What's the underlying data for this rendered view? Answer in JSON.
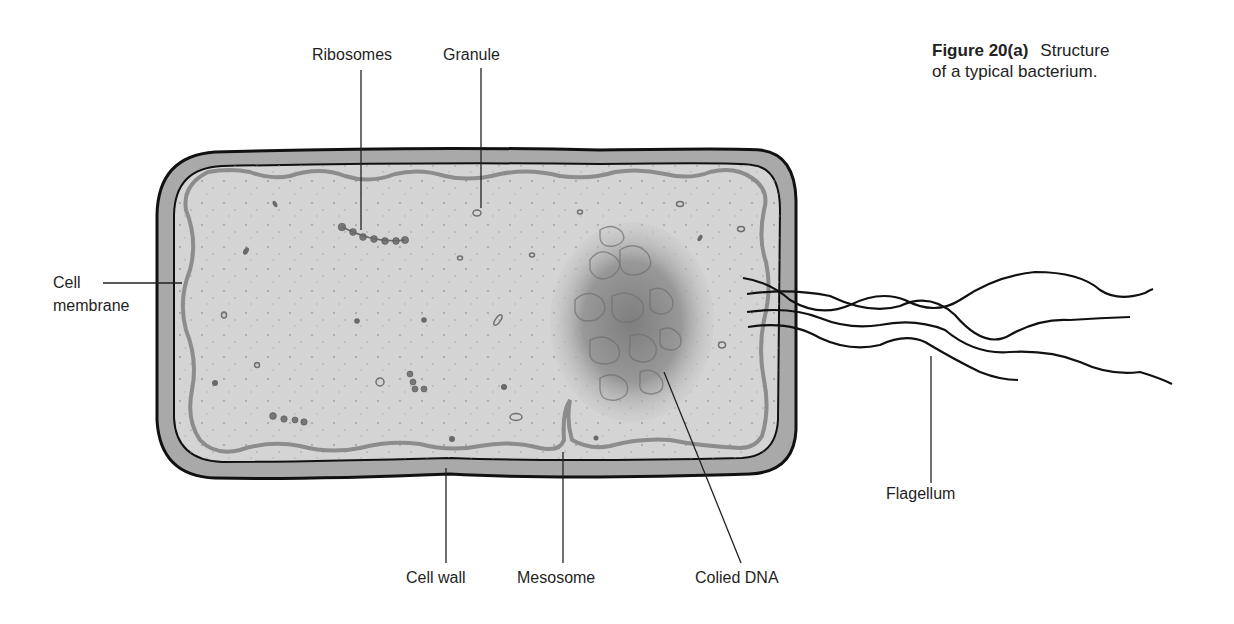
{
  "figure": {
    "number": "Figure 20(a)",
    "caption_line1_rest": "Structure",
    "caption_line2": "of a typical bacterium."
  },
  "labels": {
    "ribosomes": "Ribosomes",
    "granule": "Granule",
    "cell_membrane_line1": "Cell",
    "cell_membrane_line2": "membrane",
    "cell_wall": "Cell wall",
    "mesosome": "Mesosome",
    "coiled_dna": "Colied DNA",
    "flagellum": "Flagellum"
  },
  "colors": {
    "cytoplasm": "#d4d4d4",
    "cell_wall": "#a9a9a9",
    "membrane": "#8c8c8c",
    "outline": "#111111",
    "dna": "#8a8a8a"
  }
}
